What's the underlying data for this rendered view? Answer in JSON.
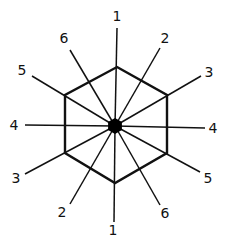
{
  "diagram": {
    "title": "",
    "stroke_color": "#111111",
    "center": {
      "x": 115,
      "y": 126,
      "fill": "#000000"
    },
    "hexagon": {
      "vertices": [
        [
          117,
          67
        ],
        [
          167,
          95
        ],
        [
          167,
          153
        ],
        [
          115,
          183
        ],
        [
          65,
          153
        ],
        [
          65,
          95
        ]
      ]
    },
    "rays": [
      {
        "label": "1",
        "end": [
          117,
          28
        ],
        "label_pos": [
          117,
          16
        ]
      },
      {
        "label": "2",
        "end": [
          160,
          48
        ],
        "label_pos": [
          165,
          38
        ]
      },
      {
        "label": "3",
        "end": [
          201,
          76
        ],
        "label_pos": [
          209,
          72
        ]
      },
      {
        "label": "4",
        "end": [
          205,
          128
        ],
        "label_pos": [
          213,
          128
        ]
      },
      {
        "label": "5",
        "end": [
          200,
          172
        ],
        "label_pos": [
          208,
          178
        ]
      },
      {
        "label": "6",
        "end": [
          160,
          205
        ],
        "label_pos": [
          165,
          213
        ]
      },
      {
        "label": "1",
        "end": [
          114,
          222
        ],
        "label_pos": [
          113,
          230
        ]
      },
      {
        "label": "2",
        "end": [
          70,
          204
        ],
        "label_pos": [
          62,
          212
        ]
      },
      {
        "label": "3",
        "end": [
          25,
          174
        ],
        "label_pos": [
          16,
          178
        ]
      },
      {
        "label": "4",
        "end": [
          25,
          125
        ],
        "label_pos": [
          14,
          125
        ]
      },
      {
        "label": "5",
        "end": [
          32,
          76
        ],
        "label_pos": [
          22,
          70
        ]
      },
      {
        "label": "6",
        "end": [
          70,
          50
        ],
        "label_pos": [
          64,
          38
        ]
      }
    ],
    "labels": [
      "1",
      "2",
      "3",
      "4",
      "5",
      "6",
      "1",
      "2",
      "3",
      "4",
      "5",
      "6"
    ]
  }
}
